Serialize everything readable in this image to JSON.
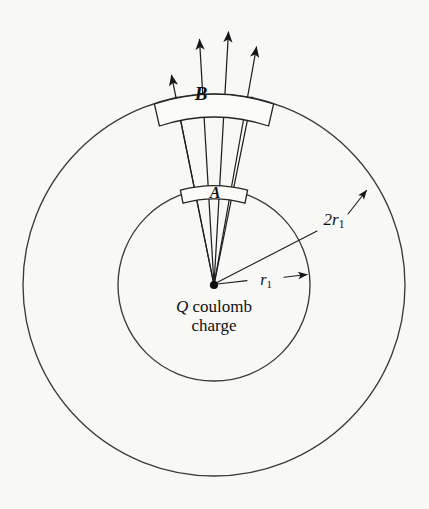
{
  "figure": {
    "background_color": "#f8f8f6",
    "ink_color": "#1f1f1f",
    "width": 429,
    "height": 509
  },
  "labels": {
    "region_b": "B",
    "region_a": "A",
    "outer_radius": "2r",
    "outer_radius_subscript": "1",
    "inner_radius": "r",
    "inner_radius_subscript": "1",
    "charge_symbol": "Q",
    "charge_line_one": " coulomb",
    "charge_line_two": "charge"
  },
  "geometry": {
    "center": {
      "x": 214,
      "y": 285
    },
    "inner_circle_radius": 96,
    "outer_circle_radius": 191,
    "cone_half_angle_deg": 11.5,
    "cone_axis_deg": -90,
    "ray_count": 4,
    "ray_overshoot": 60
  },
  "chart_data": {
    "type": "diagram",
    "elements": [
      {
        "name": "inner-sphere",
        "shape": "circle",
        "radius_label": "r1",
        "radius_px": 96,
        "center": [
          214,
          285
        ]
      },
      {
        "name": "outer-sphere",
        "shape": "circle",
        "radius_label": "2r1",
        "radius_px": 191,
        "center": [
          214,
          285
        ]
      },
      {
        "name": "patch-A",
        "shape": "spherical-cap-band",
        "on_surface": "inner-sphere",
        "label": "A"
      },
      {
        "name": "patch-B",
        "shape": "spherical-cap-band",
        "on_surface": "outer-sphere",
        "label": "B",
        "area_relative_to_A": 4
      },
      {
        "name": "point-charge",
        "shape": "dot",
        "label": "Q coulomb charge",
        "position": [
          214,
          285
        ]
      },
      {
        "name": "field-lines",
        "shape": "rays",
        "count": 4,
        "direction": "radially outward"
      }
    ],
    "annotations": [
      "r1",
      "2r1",
      "A",
      "B",
      "Q coulomb charge"
    ]
  }
}
